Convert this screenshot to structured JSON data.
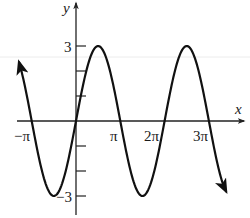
{
  "chart_data": {
    "type": "line",
    "title": "",
    "function": "y = 3 sin(x)",
    "xlabel": "x",
    "ylabel": "y",
    "x_ticks": [
      {
        "value": -3.14159,
        "label": "−π"
      },
      {
        "value": 3.14159,
        "label": "π"
      },
      {
        "value": 6.28319,
        "label": "2π"
      },
      {
        "value": 9.42478,
        "label": "3π"
      }
    ],
    "y_ticks": [
      {
        "value": 3,
        "label": "3"
      },
      {
        "value": 2,
        "label": ""
      },
      {
        "value": 1,
        "label": ""
      },
      {
        "value": -1,
        "label": ""
      },
      {
        "value": -2,
        "label": ""
      },
      {
        "value": -3,
        "label": "−3"
      }
    ],
    "xlim": [
      -4.0,
      10.9
    ],
    "ylim": [
      -3.8,
      4.8
    ],
    "x_domain_plotted": [
      -4.04,
      10.64
    ],
    "series": [
      {
        "name": "3 sin(x)",
        "amplitude": 3,
        "period": 6.28319,
        "arrows_at_ends": true,
        "key_points": [
          {
            "x": -3.14159,
            "y": 0
          },
          {
            "x": -1.5708,
            "y": -3
          },
          {
            "x": 0,
            "y": 0
          },
          {
            "x": 1.5708,
            "y": 3
          },
          {
            "x": 3.14159,
            "y": 0
          },
          {
            "x": 4.71239,
            "y": -3
          },
          {
            "x": 6.28319,
            "y": 0
          },
          {
            "x": 7.85398,
            "y": 3
          },
          {
            "x": 9.42478,
            "y": 0
          }
        ]
      }
    ],
    "grid": false,
    "legend": null
  },
  "axes": {
    "x_label": "x",
    "y_label": "y"
  },
  "style": {
    "curve_color": "#111111",
    "axis_color": "#222222",
    "artifact_line_color": "#e6e6e6"
  }
}
